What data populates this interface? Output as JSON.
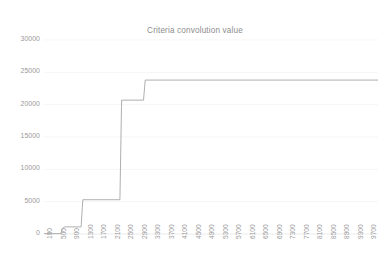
{
  "chart_data": {
    "type": "line",
    "title": "Criteria convolution value",
    "xlabel": "",
    "ylabel": "",
    "grid": true,
    "legend": false,
    "legend_position": "none",
    "line_color": "#a6a6a6",
    "text_color": "#9a9a9a",
    "grid_color": "#f2f2f2",
    "background": "#ffffff",
    "ylim": [
      0,
      30000
    ],
    "y_ticks": [
      0,
      5000,
      10000,
      15000,
      20000,
      25000,
      30000
    ],
    "y_tick_labels": [
      "0",
      "5000",
      "10000",
      "15000",
      "20000",
      "25000",
      "30000"
    ],
    "xlim": [
      100,
      10000
    ],
    "x_tick_labels": [
      "100",
      "500",
      "900",
      "1300",
      "1700",
      "2100",
      "2500",
      "2900",
      "3300",
      "3700",
      "4100",
      "4500",
      "4900",
      "5300",
      "5700",
      "6100",
      "6500",
      "6900",
      "7300",
      "7700",
      "8100",
      "8500",
      "8900",
      "9300",
      "9700"
    ],
    "x_tick_step": 400,
    "series": [
      {
        "name": "Criteria convolution value",
        "x": [
          100,
          600,
          640,
          700,
          1200,
          1250,
          2350,
          2400,
          3050,
          3100,
          10000
        ],
        "values": [
          60,
          60,
          700,
          1100,
          1100,
          5300,
          5300,
          20700,
          20700,
          23800,
          23800
        ]
      }
    ],
    "annotations": [],
    "description_steps": [
      {
        "x_start": 100,
        "x_end": 620,
        "value": 60
      },
      {
        "x_start": 700,
        "x_end": 1220,
        "value": 1100
      },
      {
        "x_start": 1250,
        "x_end": 2370,
        "value": 5300
      },
      {
        "x_start": 2400,
        "x_end": 3060,
        "value": 20700
      },
      {
        "x_start": 3100,
        "x_end": 10000,
        "value": 23800
      }
    ]
  }
}
